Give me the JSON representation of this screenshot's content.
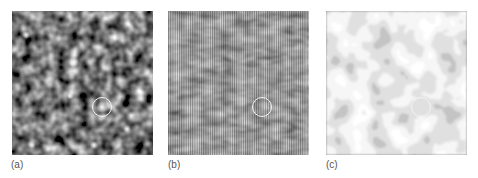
{
  "figure": {
    "panels": [
      {
        "id": "a",
        "label": "(a)",
        "description": "grayscale speckle intensity pattern with bright spots",
        "circle_marker": {
          "cx": 102,
          "cy": 107,
          "r": 10
        }
      },
      {
        "id": "b",
        "label": "(b)",
        "description": "gray pattern with vertical interference fringes",
        "circle_marker": {
          "cx": 262,
          "cy": 107,
          "r": 10
        }
      },
      {
        "id": "c",
        "label": "(c)",
        "description": "high-contrast phase map with blob-like domains",
        "circle_marker": {
          "cx": 421,
          "cy": 107,
          "r": 10
        }
      }
    ],
    "colors": {
      "background": "#ffffff",
      "circle": "#f4f4f4",
      "label": "#555555"
    }
  }
}
